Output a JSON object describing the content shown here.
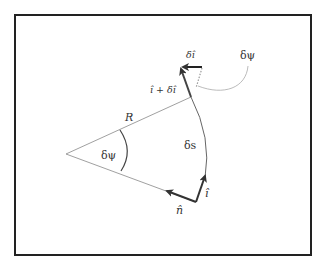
{
  "diagram": {
    "type": "geometry",
    "labels": {
      "radius": "R",
      "angle_at_center": "δψ",
      "arc_length": "δs",
      "tangent": "î",
      "normal": "n̂",
      "tangent_plus_delta": "î + δî",
      "delta_tangent": "δî",
      "angle_callout": "δψ"
    },
    "colors": {
      "frame": "#222222",
      "thin_lines": "#777777",
      "vectors": "#333333",
      "dotted": "#999999",
      "callout_curve": "#aaaaaa",
      "background": "#ffffff"
    }
  }
}
